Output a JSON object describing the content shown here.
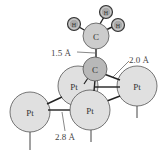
{
  "diagram": {
    "colors": {
      "pt_fill": "#e0e0e0",
      "c_fill": "#b8b8b8",
      "h_fill": "#a8a8a8",
      "outline": "#555555",
      "bond": "#222222",
      "background": "#ffffff"
    },
    "atoms": {
      "h_left": "H",
      "h_top": "H",
      "h_right": "H",
      "c_upper": "C",
      "c_lower": "C",
      "pt_back": "Pt",
      "pt_right": "Pt",
      "pt_left": "Pt",
      "pt_front": "Pt"
    },
    "labels": {
      "c_c_bond": "1.5 Å",
      "c_pt_bond": "2.0 Å",
      "pt_pt_bond": "2.8 Å"
    }
  }
}
